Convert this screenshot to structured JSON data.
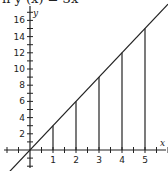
{
  "caption": "n y (x) = 3x",
  "chart_data": {
    "type": "line",
    "xlabel": "x",
    "ylabel": "y",
    "x_ticks": [
      1,
      2,
      3,
      4,
      5
    ],
    "y_ticks": [
      2,
      4,
      6,
      8,
      10,
      12,
      14,
      16
    ],
    "xlim": [
      -1.2,
      6
    ],
    "ylim": [
      -2.5,
      18
    ],
    "series": [
      {
        "name": "y = 3x",
        "x": [
          -1,
          0,
          1,
          2,
          3,
          4,
          5,
          6
        ],
        "values": [
          -3,
          0,
          3,
          6,
          9,
          12,
          15,
          18
        ]
      }
    ],
    "vertical_lines": [
      {
        "x": 1,
        "y": 3
      },
      {
        "x": 2,
        "y": 6
      },
      {
        "x": 3,
        "y": 9
      },
      {
        "x": 4,
        "y": 12
      },
      {
        "x": 5,
        "y": 15
      }
    ],
    "grid": false,
    "color": "#222222"
  }
}
